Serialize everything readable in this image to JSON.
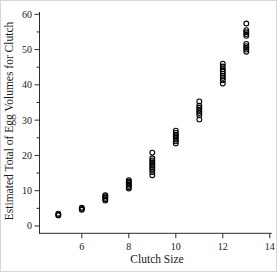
{
  "figure": {
    "background": "#ffffff",
    "axis_color": "#2b2b2b",
    "marker_color": "#000000"
  },
  "chart_data": {
    "type": "scatter",
    "title": "",
    "xlabel": "Clutch Size",
    "ylabel": "Estimated Total of Egg Volumes for Clutch",
    "xlim": [
      4.2,
      14.05
    ],
    "ylim": [
      0,
      60
    ],
    "x_ticks": [
      6,
      8,
      10,
      12,
      14
    ],
    "y_ticks": [
      0,
      10,
      20,
      30,
      40,
      50,
      60
    ],
    "y_minor_step": 5,
    "grid": false,
    "legend": null,
    "marker": {
      "shape": "open-circle",
      "radius": 2.4,
      "stroke_width": 1.1
    },
    "points": [
      [
        5,
        3.0
      ],
      [
        5,
        3.2
      ],
      [
        5,
        3.5
      ],
      [
        6,
        4.6
      ],
      [
        6,
        4.9
      ],
      [
        6,
        5.2
      ],
      [
        7,
        7.2
      ],
      [
        7,
        7.6
      ],
      [
        7,
        8.0
      ],
      [
        7,
        8.4
      ],
      [
        7,
        8.7
      ],
      [
        8,
        10.6
      ],
      [
        8,
        11.0
      ],
      [
        8,
        11.4
      ],
      [
        8,
        11.8
      ],
      [
        8,
        12.2
      ],
      [
        8,
        12.6
      ],
      [
        8,
        13.0
      ],
      [
        9,
        14.4
      ],
      [
        9,
        15.3
      ],
      [
        9,
        16.0
      ],
      [
        9,
        16.6
      ],
      [
        9,
        17.1
      ],
      [
        9,
        17.6
      ],
      [
        9,
        18.1
      ],
      [
        9,
        18.6
      ],
      [
        9,
        19.2
      ],
      [
        9,
        20.8
      ],
      [
        10,
        23.4
      ],
      [
        10,
        24.0
      ],
      [
        10,
        24.5
      ],
      [
        10,
        25.0
      ],
      [
        10,
        25.4
      ],
      [
        10,
        25.9
      ],
      [
        10,
        26.4
      ],
      [
        10,
        27.0
      ],
      [
        11,
        30.2
      ],
      [
        11,
        31.4
      ],
      [
        11,
        32.0
      ],
      [
        11,
        32.5
      ],
      [
        11,
        33.0
      ],
      [
        11,
        33.5
      ],
      [
        11,
        34.1
      ],
      [
        11,
        35.3
      ],
      [
        12,
        40.4
      ],
      [
        12,
        41.3
      ],
      [
        12,
        42.0
      ],
      [
        12,
        42.6
      ],
      [
        12,
        43.2
      ],
      [
        12,
        43.8
      ],
      [
        12,
        44.4
      ],
      [
        12,
        45.2
      ],
      [
        12,
        46.0
      ],
      [
        13,
        49.4
      ],
      [
        13,
        50.0
      ],
      [
        13,
        50.5
      ],
      [
        13,
        51.0
      ],
      [
        13,
        51.6
      ],
      [
        13,
        53.9
      ],
      [
        13,
        54.4
      ],
      [
        13,
        54.9
      ],
      [
        13,
        55.5
      ],
      [
        13,
        57.4
      ]
    ]
  }
}
